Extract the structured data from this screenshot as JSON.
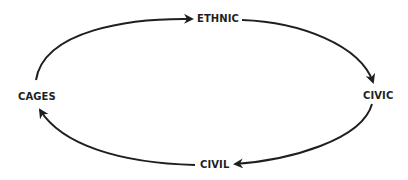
{
  "diagram": {
    "type": "cycle",
    "direction": "clockwise",
    "nodes": [
      {
        "id": "ethnic",
        "label": "ETHNIC"
      },
      {
        "id": "civic",
        "label": "CIVIC"
      },
      {
        "id": "civil",
        "label": "CIVIL"
      },
      {
        "id": "cages",
        "label": "CAGES"
      }
    ],
    "edges": [
      {
        "from": "cages",
        "to": "ethnic"
      },
      {
        "from": "ethnic",
        "to": "civic"
      },
      {
        "from": "civic",
        "to": "civil"
      },
      {
        "from": "civil",
        "to": "cages"
      }
    ],
    "colors": {
      "stroke": "#1f1f1f",
      "text": "#1f1f1f",
      "background": "#ffffff"
    }
  }
}
